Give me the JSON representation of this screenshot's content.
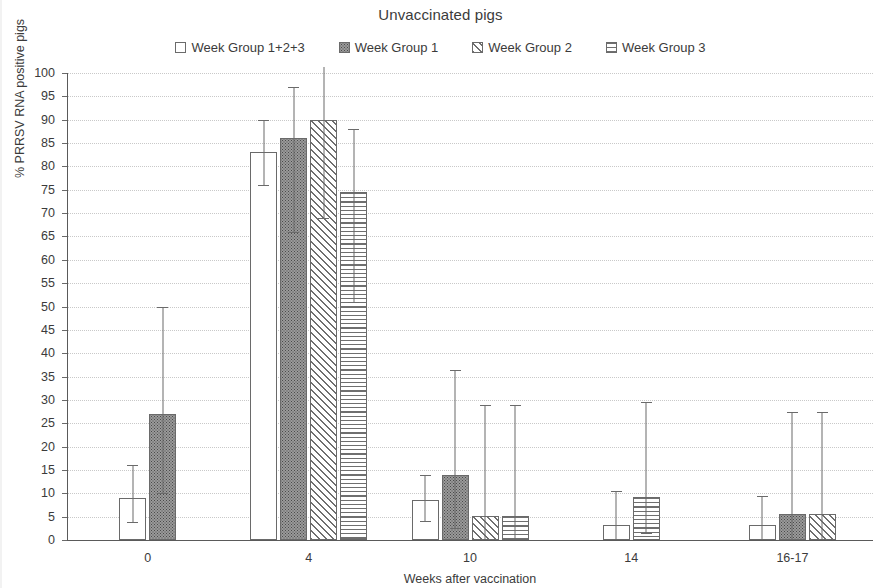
{
  "chart_data": {
    "type": "bar",
    "title": "Unvaccinated pigs",
    "xlabel": "Weeks after vaccination",
    "ylabel": "% PRRSV RNA positive pigs",
    "ylim": [
      0,
      100
    ],
    "ytick_step": 5,
    "yticks": [
      100,
      95,
      90,
      85,
      80,
      75,
      70,
      65,
      60,
      55,
      50,
      45,
      40,
      35,
      30,
      25,
      20,
      15,
      10,
      5,
      0
    ],
    "grid": true,
    "legend_position": "top",
    "categories": [
      "0",
      "4",
      "10",
      "14",
      "16-17"
    ],
    "series": [
      {
        "name": "Week Group 1+2+3",
        "pattern": "none",
        "values": [
          9.0,
          83.0,
          8.5,
          3.3,
          3.3
        ],
        "err_low": [
          3.8,
          76.0,
          4.0,
          0.0,
          0.0
        ],
        "err_high": [
          16.0,
          90.0,
          14.0,
          10.5,
          9.5
        ]
      },
      {
        "name": "Week Group 1",
        "pattern": "dots",
        "values": [
          27.0,
          86.0,
          14.0,
          null,
          5.5
        ],
        "err_low": [
          10.0,
          66.0,
          2.5,
          null,
          0.0
        ],
        "err_high": [
          50.0,
          97.0,
          36.5,
          null,
          27.5
        ]
      },
      {
        "name": "Week Group 2",
        "pattern": "diagonal",
        "values": [
          null,
          90.0,
          5.2,
          null,
          5.5
        ],
        "err_low": [
          null,
          69.0,
          0.0,
          null,
          0.0
        ],
        "err_high": [
          null,
          102.0,
          29.0,
          null,
          27.5
        ]
      },
      {
        "name": "Week Group 3",
        "pattern": "horizontal",
        "values": [
          null,
          74.5,
          5.2,
          9.3,
          null
        ],
        "err_low": [
          null,
          51.0,
          0.0,
          1.5,
          null
        ],
        "err_high": [
          null,
          88.0,
          29.0,
          29.5,
          null
        ]
      }
    ]
  },
  "legend": {
    "items": [
      {
        "label": "Week Group 1+2+3",
        "pattern": "none"
      },
      {
        "label": "Week Group 1",
        "pattern": "dots"
      },
      {
        "label": "Week Group 2",
        "pattern": "diagonal"
      },
      {
        "label": "Week Group 3",
        "pattern": "horizontal"
      }
    ]
  },
  "colors": {
    "axis": "#5a5a5a",
    "grid": "#c9c9c9",
    "text": "#3b3b3b",
    "bar_outline": "#6a6a6a",
    "dot_fill": "#9a9a9a",
    "background": "#ffffff"
  }
}
